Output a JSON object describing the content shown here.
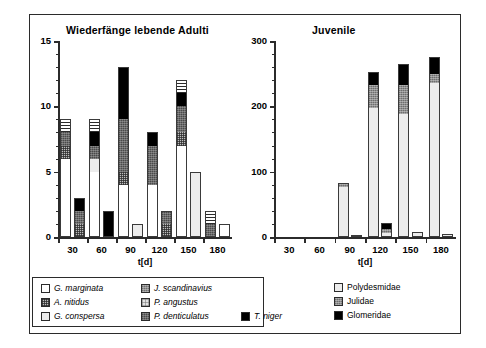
{
  "figure": {
    "charts": [
      {
        "id": "adults",
        "title": "Wiederfänge lebende Adulti",
        "xlabel": "t[d]",
        "ylabel": "",
        "ylim": [
          0,
          15
        ],
        "yticks": [
          0,
          5,
          10,
          15
        ],
        "yticklabels": [
          "0",
          "5",
          "10",
          "15"
        ],
        "xticklabels": [
          "30",
          "60",
          "90",
          "120",
          "150",
          "180"
        ]
      },
      {
        "id": "juvenile",
        "title": "Juvenile",
        "xlabel": "t[d]",
        "ylabel": "",
        "ylim": [
          0,
          300
        ],
        "yticks": [
          0,
          100,
          200,
          300
        ],
        "yticklabels": [
          "0",
          "100",
          "200",
          "300"
        ],
        "xticklabels": [
          "30",
          "60",
          "90",
          "120",
          "150",
          "180"
        ]
      }
    ],
    "legend_left": {
      "entries": [
        {
          "label": "G. marginata",
          "swatch": "f-white",
          "col": 0,
          "row": 0
        },
        {
          "label": "A. nitidus",
          "swatch": "f-checker",
          "col": 0,
          "row": 1
        },
        {
          "label": "G. conspersa",
          "swatch": "f-vlight",
          "col": 0,
          "row": 2
        },
        {
          "label": "J. scandinavius",
          "swatch": "f-mgray",
          "col": 1,
          "row": 0
        },
        {
          "label": "P. angustus",
          "swatch": "f-light",
          "col": 1,
          "row": 1
        },
        {
          "label": "P. denticulatus",
          "swatch": "f-dgray",
          "col": 1,
          "row": 2
        },
        {
          "label": "T. niger",
          "swatch": "f-black",
          "col": 2,
          "row": 2
        }
      ]
    },
    "legend_right": {
      "entries": [
        {
          "label": "Polydesmidae",
          "swatch": "f-vlight"
        },
        {
          "label": "Julidae",
          "swatch": "f-mgray"
        },
        {
          "label": "Glomeridae",
          "swatch": "f-black"
        }
      ]
    }
  },
  "chart_data": [
    {
      "type": "bar",
      "subtype": "stacked-grouped",
      "title": "Wiederfänge lebende Adulti",
      "xlabel": "t[d]",
      "ylabel": "",
      "ylim": [
        0,
        15
      ],
      "yticks": [
        0,
        5,
        10,
        15
      ],
      "grid": false,
      "legend_position": "below-figure-left",
      "categories": [
        "30",
        "60",
        "90",
        "120",
        "150",
        "180"
      ],
      "bars_per_category": 2,
      "series": [
        {
          "name": "G. marginata",
          "swatch": "white",
          "values_bar1": [
            6,
            5,
            4,
            4,
            7,
            0
          ],
          "values_bar2": [
            0,
            0,
            0,
            0,
            0,
            1
          ]
        },
        {
          "name": "A. nitidus",
          "swatch": "checker",
          "values_bar1": [
            1,
            0,
            1,
            0,
            1,
            0
          ],
          "values_bar2": [
            1,
            0,
            0,
            1,
            0,
            0
          ]
        },
        {
          "name": "G. conspersa",
          "swatch": "very-light",
          "values_bar1": [
            0,
            1,
            0,
            0,
            0,
            0
          ],
          "values_bar2": [
            0,
            0,
            1,
            0,
            5,
            0
          ]
        },
        {
          "name": "J. scandinavius",
          "swatch": "medium-gray",
          "values_bar1": [
            0,
            0,
            0,
            0,
            0,
            0
          ],
          "values_bar2": [
            0,
            0,
            0,
            0,
            0,
            0
          ]
        },
        {
          "name": "P. angustus",
          "swatch": "light-dotted",
          "values_bar1": [
            0,
            0,
            0,
            0,
            0,
            0
          ],
          "values_bar2": [
            0,
            0,
            0,
            0,
            0,
            0
          ]
        },
        {
          "name": "P. denticulatus",
          "swatch": "dark-gray",
          "values_bar1": [
            1,
            1,
            4,
            3,
            2,
            1
          ],
          "values_bar2": [
            1,
            0,
            0,
            1,
            0,
            0
          ]
        },
        {
          "name": "T. niger",
          "swatch": "black",
          "values_bar1": [
            0,
            1,
            4,
            1,
            1,
            0
          ],
          "values_bar2": [
            1,
            2,
            0,
            0,
            0,
            0
          ]
        },
        {
          "name": "hatched-horiz",
          "swatch": "hatch-horiz",
          "values_bar1": [
            1,
            1,
            0,
            0,
            1,
            1
          ],
          "values_bar2": [
            0,
            0,
            0,
            0,
            0,
            0
          ]
        }
      ],
      "bar1_totals": [
        9,
        9,
        13,
        8,
        12,
        7
      ],
      "bar2_totals": [
        3,
        2,
        1,
        2,
        5,
        4
      ]
    },
    {
      "type": "bar",
      "subtype": "stacked-grouped",
      "title": "Juvenile",
      "xlabel": "t[d]",
      "ylabel": "",
      "ylim": [
        0,
        300
      ],
      "yticks": [
        0,
        100,
        200,
        300
      ],
      "grid": false,
      "legend_position": "below-figure-right",
      "categories": [
        "30",
        "60",
        "90",
        "120",
        "150",
        "180"
      ],
      "bars_per_category": 2,
      "series": [
        {
          "name": "Polydesmidae",
          "swatch": "very-light",
          "values_bar1": [
            0,
            0,
            76,
            197,
            188,
            236
          ],
          "values_bar2": [
            0,
            0,
            2,
            6,
            6,
            4
          ]
        },
        {
          "name": "Julidae",
          "swatch": "medium-gray",
          "values_bar1": [
            0,
            0,
            6,
            36,
            45,
            14
          ],
          "values_bar2": [
            0,
            0,
            0,
            6,
            2,
            0
          ]
        },
        {
          "name": "Glomeridae",
          "swatch": "black",
          "values_bar1": [
            0,
            0,
            0,
            20,
            32,
            26
          ],
          "values_bar2": [
            0,
            0,
            0,
            10,
            0,
            0
          ]
        }
      ],
      "bar1_totals": [
        0,
        0,
        82,
        253,
        265,
        276
      ],
      "bar2_totals": [
        0,
        0,
        2,
        22,
        8,
        4
      ]
    }
  ]
}
